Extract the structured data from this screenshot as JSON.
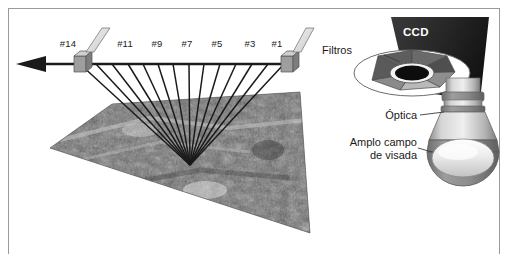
{
  "figure": {
    "border_color": "#9a9a9a",
    "background": "#ffffff"
  },
  "scan_diagram": {
    "name": "swath-scan-diagram",
    "axis_arrow": "arrow-left",
    "convergence_point": {
      "x": 190,
      "y": 165
    },
    "axis_y": 64,
    "marker_positions": [
      78,
      285
    ],
    "tick_labels": [
      {
        "text": "#14",
        "x": 68,
        "y": 47
      },
      {
        "text": "#11",
        "x": 125,
        "y": 47
      },
      {
        "text": "#9",
        "x": 157,
        "y": 47
      },
      {
        "text": "#7",
        "x": 187,
        "y": 47
      },
      {
        "text": "#5",
        "x": 217,
        "y": 47
      },
      {
        "text": "#3",
        "x": 250,
        "y": 47
      },
      {
        "text": "#1",
        "x": 277,
        "y": 47
      }
    ],
    "line_count": 14,
    "line_color": "#1a1a1a",
    "terrain": {
      "name": "terrain-image",
      "description": "imagem de satelite em tons de cinza",
      "fill": "#6f6f6f"
    }
  },
  "instrument_diagram": {
    "name": "ccd-instrument-diagram",
    "ccd": {
      "label": "CCD",
      "fill": "#2b2b2b"
    },
    "filters": {
      "label": "Filtros",
      "leader_to": {
        "x": 408,
        "y": 70
      }
    },
    "optics": {
      "label": "Óptica",
      "leader_to": {
        "x": 452,
        "y": 112
      }
    },
    "field_of_view": {
      "label_line1": "Amplo campo",
      "label_line2": "de visada",
      "leader_to": {
        "x": 440,
        "y": 155
      }
    }
  },
  "colors": {
    "ink": "#1a1a1a",
    "ccd_dark": "#2b2b2b",
    "metal_light": "#d8d8d8",
    "metal_mid": "#a6a6a6",
    "metal_dark": "#767676",
    "white": "#ffffff"
  }
}
